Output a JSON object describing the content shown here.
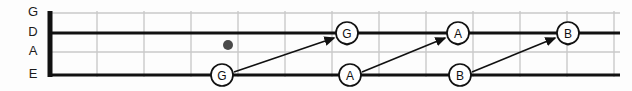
{
  "diagram": {
    "type": "fretboard",
    "width": 632,
    "height": 91,
    "colors": {
      "background": "#fdfdfd",
      "string_thick": "#111111",
      "string_thin": "#c9c9c9",
      "fret_line": "#c9c9c9",
      "nut": "#111111",
      "note_stroke": "#111111",
      "note_fill": "#ffffff",
      "note_text": "#111111",
      "arrow": "#111111",
      "fret_dot": "#4a4a4a",
      "label_text": "#1b1b1b"
    }
  },
  "strings": [
    {
      "name": "G",
      "label": "G",
      "y": 13,
      "weight": "thin",
      "x_start": 50,
      "x_end": 620
    },
    {
      "name": "D",
      "label": "D",
      "y": 33,
      "weight": "thick",
      "x_start": 50,
      "x_end": 620
    },
    {
      "name": "A",
      "label": "A",
      "y": 52,
      "weight": "thin",
      "x_start": 50,
      "x_end": 620
    },
    {
      "name": "E",
      "label": "E",
      "y": 75,
      "weight": "thick",
      "x_start": 50,
      "x_end": 620
    }
  ],
  "string_labels": [
    {
      "text": "G",
      "x": 33,
      "y": 13
    },
    {
      "text": "D",
      "x": 33,
      "y": 33
    },
    {
      "text": "A",
      "x": 33,
      "y": 52
    },
    {
      "text": "E",
      "x": 33,
      "y": 75
    }
  ],
  "nut": {
    "x": 50,
    "y_top": 11,
    "y_bottom": 77,
    "width": 5
  },
  "fret_lines": [
    {
      "index": 1,
      "x": 97
    },
    {
      "index": 2,
      "x": 144
    },
    {
      "index": 3,
      "x": 191
    },
    {
      "index": 4,
      "x": 238
    },
    {
      "index": 5,
      "x": 285
    },
    {
      "index": 6,
      "x": 332
    },
    {
      "index": 7,
      "x": 379
    },
    {
      "index": 8,
      "x": 426
    },
    {
      "index": 9,
      "x": 473
    },
    {
      "index": 10,
      "x": 520
    },
    {
      "index": 11,
      "x": 567
    },
    {
      "index": 12,
      "x": 614
    }
  ],
  "fret_dots": [
    {
      "x": 228,
      "y": 45,
      "r": 5
    }
  ],
  "notes": [
    {
      "id": "e-g",
      "label": "G",
      "string": "E",
      "x": 222,
      "y": 75,
      "r": 11,
      "tail": false
    },
    {
      "id": "d-g",
      "label": "G",
      "string": "D",
      "x": 347,
      "y": 33,
      "r": 11,
      "tail": true
    },
    {
      "id": "e-a",
      "label": "A",
      "string": "E",
      "x": 350,
      "y": 75,
      "r": 11,
      "tail": false
    },
    {
      "id": "d-a",
      "label": "A",
      "string": "D",
      "x": 458,
      "y": 33,
      "r": 11,
      "tail": true
    },
    {
      "id": "e-b",
      "label": "B",
      "string": "E",
      "x": 460,
      "y": 75,
      "r": 11,
      "tail": false
    },
    {
      "id": "d-b",
      "label": "B",
      "string": "D",
      "x": 568,
      "y": 33,
      "r": 11,
      "tail": true
    }
  ],
  "arrows": [
    {
      "id": "arrow-g",
      "from_note": "e-g",
      "to_note": "d-g",
      "x1": 234,
      "y1": 72,
      "x2": 334,
      "y2": 38
    },
    {
      "id": "arrow-a",
      "from_note": "e-a",
      "to_note": "d-a",
      "x1": 362,
      "y1": 72,
      "x2": 445,
      "y2": 38
    },
    {
      "id": "arrow-b",
      "from_note": "e-b",
      "to_note": "d-b",
      "x1": 472,
      "y1": 72,
      "x2": 555,
      "y2": 38
    }
  ]
}
